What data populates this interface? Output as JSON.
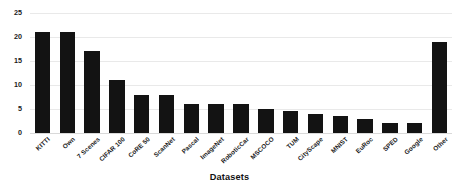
{
  "chart_data": {
    "type": "bar",
    "title": "",
    "xlabel": "Datasets",
    "ylabel": "",
    "categories": [
      "KITTI",
      "Own",
      "7 Scenes",
      "CIFAR 100",
      "CoRE 50",
      "ScanNet",
      "Pascal",
      "ImageNet",
      "RoboticCar",
      "MSCOCO",
      "TUM",
      "CityScape",
      "MNIST",
      "EuRoc",
      "SPED",
      "Google",
      "Other"
    ],
    "values": [
      21,
      21,
      17,
      11,
      8,
      8,
      6,
      6,
      6,
      5,
      4.5,
      4,
      3.5,
      3,
      2,
      2,
      19
    ],
    "ylim": [
      0,
      25
    ],
    "yticks": [
      0,
      5,
      10,
      15,
      20,
      25
    ],
    "ytick_labels": [
      "0",
      "5",
      "10",
      "15",
      "20",
      "25"
    ],
    "grid": true,
    "legend": false,
    "bar_color": "#131313",
    "grid_color": "#e9e9e9",
    "background": "#ffffff"
  },
  "axis": {
    "x_title": "Datasets"
  }
}
